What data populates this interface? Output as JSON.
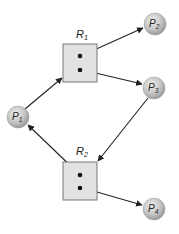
{
  "diagram": {
    "colors": {
      "background": "#ffffff",
      "resource_fill": "#e2e2e2",
      "resource_stroke": "#777777",
      "process_fill": "#c4c4c4",
      "edge": "#222222",
      "dot": "#111111"
    },
    "processes": [
      {
        "id": "P1",
        "label": "P",
        "sub": "1",
        "cx": 18,
        "cy": 117
      },
      {
        "id": "P2",
        "label": "P",
        "sub": "2",
        "cx": 155,
        "cy": 24
      },
      {
        "id": "P3",
        "label": "P",
        "sub": "3",
        "cx": 154,
        "cy": 88
      },
      {
        "id": "P4",
        "label": "P",
        "sub": "4",
        "cx": 154,
        "cy": 209
      }
    ],
    "resources": [
      {
        "id": "R1",
        "label": "R",
        "sub": "1",
        "x": 63,
        "y": 44,
        "w": 34,
        "h": 38,
        "instances": 2
      },
      {
        "id": "R2",
        "label": "R",
        "sub": "2",
        "x": 63,
        "y": 162,
        "w": 34,
        "h": 38,
        "instances": 2
      }
    ],
    "edges": [
      {
        "from": "P1",
        "to": "R1",
        "type": "request"
      },
      {
        "from": "R1",
        "to": "P2",
        "type": "assignment"
      },
      {
        "from": "R1",
        "to": "P3",
        "type": "assignment"
      },
      {
        "from": "P3",
        "to": "R2",
        "type": "request"
      },
      {
        "from": "R2",
        "to": "P1",
        "type": "assignment"
      },
      {
        "from": "R2",
        "to": "P4",
        "type": "assignment"
      }
    ]
  }
}
